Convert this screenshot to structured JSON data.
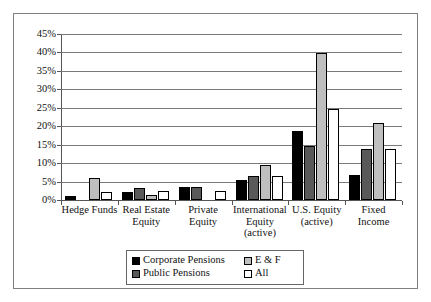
{
  "chart_data": {
    "type": "bar",
    "title": "",
    "xlabel": "",
    "ylabel": "",
    "ylim": [
      0,
      45
    ],
    "ytick_labels": [
      "45%",
      "40%",
      "35%",
      "30%",
      "25%",
      "20%",
      "15%",
      "10%",
      "5%",
      "0%"
    ],
    "ytick_values": [
      45,
      40,
      35,
      30,
      25,
      20,
      15,
      10,
      5,
      0
    ],
    "grid": true,
    "legend_position": "bottom-center",
    "categories": [
      "Hedge Funds",
      "Real Estate Equity",
      "Private Equity",
      "International Equity (active)",
      "U.S. Equity (active)",
      "Fixed Income"
    ],
    "category_lines": [
      [
        "Hedge Funds"
      ],
      [
        "Real Estate",
        "Equity"
      ],
      [
        "Private",
        "Equity"
      ],
      [
        "International",
        "Equity",
        "(active)"
      ],
      [
        "U.S. Equity",
        "(active)"
      ],
      [
        "Fixed",
        "Income"
      ]
    ],
    "series": [
      {
        "name": "Corporate Pensions",
        "color": "#000000",
        "values": [
          1.0,
          2.2,
          3.4,
          5.5,
          18.8,
          6.8
        ]
      },
      {
        "name": "Public Pensions",
        "color": "#595959",
        "values": [
          0,
          3.2,
          3.5,
          6.6,
          14.7,
          13.9
        ]
      },
      {
        "name": "E & F",
        "color": "#bfbfbf",
        "values": [
          6.1,
          1.3,
          0,
          9.6,
          39.8,
          21.0
        ]
      },
      {
        "name": "All",
        "color": "#ffffff",
        "values": [
          2.2,
          2.4,
          2.5,
          6.6,
          24.7,
          13.9
        ]
      }
    ]
  },
  "legend": {
    "entries": [
      {
        "label": "Corporate Pensions",
        "series": 0
      },
      {
        "label": "E & F",
        "series": 2
      },
      {
        "label": "Public Pensions",
        "series": 1
      },
      {
        "label": "All",
        "series": 3
      }
    ]
  }
}
